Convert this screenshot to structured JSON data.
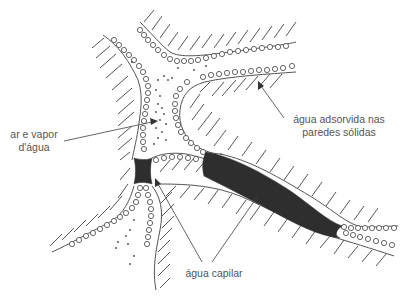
{
  "diagram": {
    "labels": {
      "air": {
        "line1": "ar e vapor",
        "line2": "d'água"
      },
      "adsorbed": {
        "line1": "água adsorvida nas",
        "line2": "paredes sólidas"
      },
      "capillary": {
        "line1": "água capilar"
      }
    },
    "colors": {
      "background": "#ffffff",
      "line": "#555555",
      "capillary_water": "#2e2e2e",
      "label_text": "#555555"
    },
    "regions": [
      "solid-particle-upper-left",
      "solid-particle-upper-right",
      "solid-particle-center",
      "solid-particle-lower-left",
      "solid-particle-lower-right",
      "solid-particle-bottom"
    ]
  }
}
